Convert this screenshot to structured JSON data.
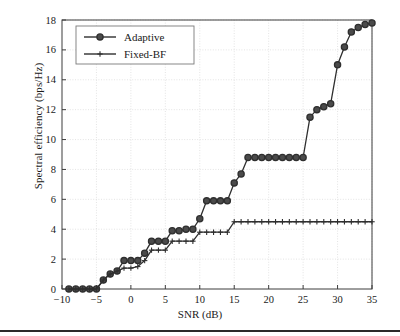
{
  "figure": {
    "background": "#ffffff",
    "axis_color": "#3d3d3d",
    "grid_color": "#d9d9d9",
    "series_color": "#2f2f2f"
  },
  "axes": {
    "x_title": "SNR (dB)",
    "y_title": "Spectral efficiency (bps/Hz)",
    "x_ticks": [
      "−10",
      "−5",
      "0",
      "5",
      "10",
      "15",
      "20",
      "25",
      "30",
      "35"
    ],
    "y_ticks": [
      "0",
      "2",
      "4",
      "6",
      "8",
      "10",
      "12",
      "14",
      "16",
      "18"
    ]
  },
  "legend": {
    "entries": [
      {
        "label": "Adaptive",
        "marker": "circle-marker"
      },
      {
        "label": "Fixed-BF",
        "marker": "plus-marker"
      }
    ]
  },
  "chart_data": {
    "type": "line",
    "title": "",
    "xlabel": "SNR (dB)",
    "ylabel": "Spectral efficiency (bps/Hz)",
    "xlim": [
      -10,
      35
    ],
    "ylim": [
      0,
      18
    ],
    "xticks": [
      -10,
      -5,
      0,
      5,
      10,
      15,
      20,
      25,
      30,
      35
    ],
    "yticks": [
      0,
      2,
      4,
      6,
      8,
      10,
      12,
      14,
      16,
      18
    ],
    "grid": true,
    "legend_position": "upper-left",
    "x": [
      -9,
      -8,
      -7,
      -6,
      -5,
      -4,
      -3,
      -2,
      -1,
      0,
      1,
      2,
      3,
      4,
      5,
      6,
      7,
      8,
      9,
      10,
      11,
      12,
      13,
      14,
      15,
      16,
      17,
      18,
      19,
      20,
      21,
      22,
      23,
      24,
      25,
      26,
      27,
      28,
      29,
      30,
      31,
      32,
      33,
      34,
      35
    ],
    "series": [
      {
        "name": "Adaptive",
        "marker": "circle",
        "values": [
          0,
          0,
          0,
          0,
          0,
          0.6,
          1.0,
          1.2,
          1.9,
          1.9,
          1.9,
          2.4,
          3.2,
          3.2,
          3.2,
          3.9,
          3.9,
          4.0,
          4.0,
          4.7,
          5.9,
          5.9,
          5.9,
          5.9,
          7.1,
          7.7,
          8.8,
          8.8,
          8.8,
          8.8,
          8.8,
          8.8,
          8.8,
          8.8,
          8.8,
          11.5,
          12.0,
          12.2,
          12.4,
          15.0,
          16.2,
          17.2,
          17.5,
          17.7,
          17.8
        ]
      },
      {
        "name": "Fixed-BF",
        "marker": "plus",
        "values": [
          0,
          0,
          0,
          0,
          0,
          0.6,
          1.0,
          1.2,
          1.4,
          1.4,
          1.5,
          1.9,
          2.6,
          2.6,
          2.6,
          3.2,
          3.2,
          3.2,
          3.2,
          3.8,
          3.8,
          3.8,
          3.8,
          3.8,
          4.5,
          4.5,
          4.5,
          4.5,
          4.5,
          4.5,
          4.5,
          4.5,
          4.5,
          4.5,
          4.5,
          4.5,
          4.5,
          4.5,
          4.5,
          4.5,
          4.5,
          4.5,
          4.5,
          4.5,
          4.5
        ]
      }
    ]
  }
}
